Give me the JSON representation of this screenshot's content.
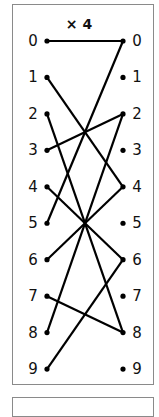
{
  "diagram": {
    "title": "× 4",
    "multiplier": 4,
    "modulus": 10,
    "left_labels": [
      "0",
      "1",
      "2",
      "3",
      "4",
      "5",
      "6",
      "7",
      "8",
      "9"
    ],
    "right_labels": [
      "0",
      "1",
      "2",
      "3",
      "4",
      "5",
      "6",
      "7",
      "8",
      "9"
    ],
    "mappings": [
      {
        "from": 0,
        "to": 0
      },
      {
        "from": 1,
        "to": 4
      },
      {
        "from": 2,
        "to": 8
      },
      {
        "from": 3,
        "to": 2
      },
      {
        "from": 4,
        "to": 6
      },
      {
        "from": 5,
        "to": 0
      },
      {
        "from": 6,
        "to": 4
      },
      {
        "from": 7,
        "to": 8
      },
      {
        "from": 8,
        "to": 2
      },
      {
        "from": 9,
        "to": 6
      }
    ],
    "line_color": "#000000",
    "border_color": "#8a8a8a"
  }
}
